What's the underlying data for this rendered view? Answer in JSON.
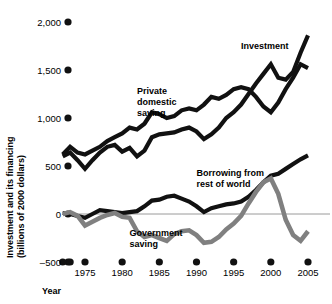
{
  "chart_data": {
    "type": "line",
    "title": "",
    "xlabel": "Year",
    "ylabel": "Investment and its financing (billions of 2000 dollars)",
    "ylabel_line1": "Investment and its financing",
    "ylabel_line2": "(billions of 2000 dollars)",
    "xlim": [
      1972,
      2006
    ],
    "ylim": [
      -500,
      2000
    ],
    "yticks": [
      2000,
      1500,
      1000,
      500,
      0,
      -500
    ],
    "ytick_labels": [
      "2,000",
      "1,500",
      "1,000",
      "500",
      "0",
      "–500"
    ],
    "xticks": [
      1975,
      1980,
      1985,
      1990,
      1995,
      2000,
      2005
    ],
    "xtick_labels": [
      "1975",
      "1980",
      "1985",
      "1990",
      "1995",
      "2000",
      "2005"
    ],
    "extra_xtick_years": [
      1972,
      1973
    ],
    "grid": false,
    "zero_line": true,
    "legend": "inline-labels",
    "colors": {
      "dark": "#111111",
      "gray": "#808080",
      "zero_line": "#9a9a9a",
      "background": "#ffffff"
    },
    "series": [
      {
        "name": "Investment",
        "color": "#111111",
        "label_x": 1996,
        "label_y": 1720,
        "x": [
          1972,
          1973,
          1974,
          1975,
          1976,
          1977,
          1978,
          1979,
          1980,
          1981,
          1982,
          1983,
          1984,
          1985,
          1986,
          1987,
          1988,
          1989,
          1990,
          1991,
          1992,
          1993,
          1994,
          1995,
          1996,
          1997,
          1998,
          1999,
          2000,
          2001,
          2002,
          2003,
          2004,
          2005
        ],
        "y": [
          600,
          640,
          560,
          470,
          560,
          640,
          700,
          720,
          650,
          690,
          600,
          660,
          800,
          830,
          840,
          850,
          880,
          900,
          860,
          780,
          830,
          900,
          1000,
          1060,
          1140,
          1250,
          1360,
          1460,
          1560,
          1420,
          1400,
          1480,
          1680,
          1860
        ]
      },
      {
        "name": "Private domestic saving",
        "color": "#111111",
        "label_x": 1982,
        "label_y": 1250,
        "label_lines": [
          "Private",
          "domestic",
          "saving"
        ],
        "x": [
          1972,
          1973,
          1974,
          1975,
          1976,
          1977,
          1978,
          1979,
          1980,
          1981,
          1982,
          1983,
          1984,
          1985,
          1986,
          1987,
          1988,
          1989,
          1990,
          1991,
          1992,
          1993,
          1994,
          1995,
          1996,
          1997,
          1998,
          1999,
          2000,
          2001,
          2002,
          2003,
          2004,
          2005
        ],
        "y": [
          620,
          700,
          640,
          620,
          660,
          700,
          760,
          800,
          840,
          900,
          880,
          940,
          1060,
          1040,
          1000,
          1020,
          1080,
          1100,
          1080,
          1140,
          1220,
          1200,
          1240,
          1300,
          1320,
          1300,
          1220,
          1120,
          1060,
          1160,
          1300,
          1420,
          1560,
          1520
        ]
      },
      {
        "name": "Borrowing from rest of world",
        "color": "#111111",
        "label_x": 1990,
        "label_y": 400,
        "label_lines": [
          "Borrowing from",
          "rest of world"
        ],
        "x": [
          1972,
          1973,
          1974,
          1975,
          1976,
          1977,
          1978,
          1979,
          1980,
          1981,
          1982,
          1983,
          1984,
          1985,
          1986,
          1987,
          1988,
          1989,
          1990,
          1991,
          1992,
          1993,
          1994,
          1995,
          1996,
          1997,
          1998,
          1999,
          2000,
          2001,
          2002,
          2003,
          2004,
          2005
        ],
        "y": [
          10,
          0,
          -20,
          -40,
          0,
          40,
          30,
          20,
          10,
          20,
          30,
          80,
          140,
          150,
          180,
          190,
          160,
          130,
          80,
          20,
          60,
          80,
          100,
          110,
          130,
          180,
          250,
          330,
          400,
          420,
          470,
          520,
          570,
          610
        ]
      },
      {
        "name": "Government saving",
        "color": "#808080",
        "label_x": 1981,
        "label_y": -230,
        "label_lines": [
          "Government",
          "saving"
        ],
        "x": [
          1972,
          1973,
          1974,
          1975,
          1976,
          1977,
          1978,
          1979,
          1980,
          1981,
          1982,
          1983,
          1984,
          1985,
          1986,
          1987,
          1988,
          1989,
          1990,
          1991,
          1992,
          1993,
          1994,
          1995,
          1996,
          1997,
          1998,
          1999,
          2000,
          2001,
          2002,
          2003,
          2004,
          2005
        ],
        "y": [
          0,
          20,
          -20,
          -120,
          -80,
          -40,
          -10,
          10,
          -30,
          -40,
          -180,
          -240,
          -220,
          -250,
          -280,
          -210,
          -180,
          -170,
          -220,
          -300,
          -290,
          -240,
          -160,
          -100,
          -20,
          110,
          230,
          330,
          370,
          210,
          -60,
          -220,
          -280,
          -180
        ]
      }
    ]
  },
  "axis": {
    "y_title_line1": "Investment and its financing",
    "y_title_line2": "(billions of 2000 dollars)",
    "x_title": "Year"
  }
}
